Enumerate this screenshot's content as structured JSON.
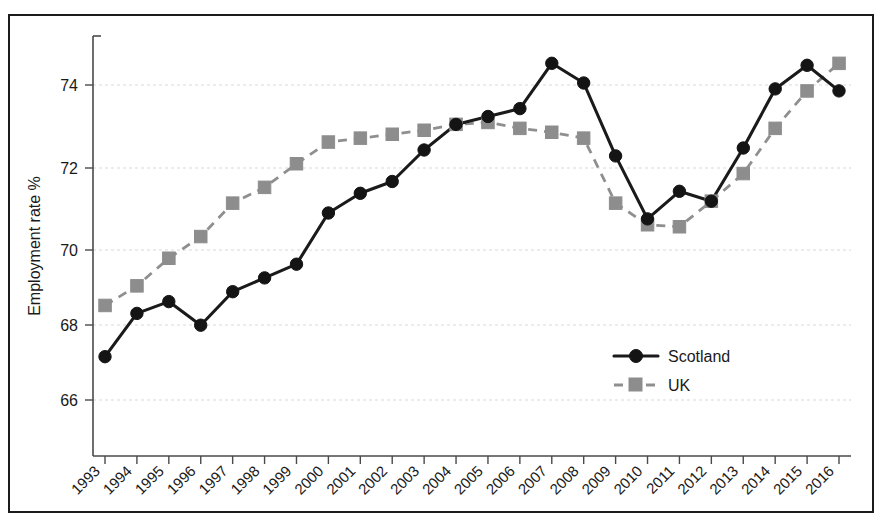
{
  "chart_data": {
    "type": "line",
    "title": "",
    "subtitle": "",
    "xlabel": "",
    "ylabel": "Employment rate %",
    "categories": [
      "1993",
      "1994",
      "1995",
      "1996",
      "1997",
      "1998",
      "1999",
      "2000",
      "2001",
      "2002",
      "2003",
      "2004",
      "2005",
      "2006",
      "2007",
      "2008",
      "2009",
      "2010",
      "2011",
      "2012",
      "2013",
      "2014",
      "2015",
      "2016"
    ],
    "x": [
      1993,
      1994,
      1995,
      1996,
      1997,
      1998,
      1999,
      2000,
      2001,
      2002,
      2003,
      2004,
      2005,
      2006,
      2007,
      2008,
      2009,
      2010,
      2011,
      2012,
      2013,
      2014,
      2015,
      2016
    ],
    "series": [
      {
        "name": "Scotland",
        "color": "#141414",
        "marker": "circle",
        "line_style": "solid",
        "values": [
          67.1,
          68.2,
          68.5,
          67.9,
          68.75,
          69.1,
          69.45,
          70.75,
          71.25,
          71.55,
          72.35,
          73.0,
          73.2,
          73.4,
          74.55,
          74.05,
          72.2,
          70.6,
          71.3,
          71.05,
          72.4,
          73.9,
          74.5,
          73.85
        ]
      },
      {
        "name": "UK",
        "color": "#8d8d8d",
        "marker": "square",
        "line_style": "dashed",
        "values": [
          68.4,
          68.9,
          69.6,
          70.15,
          71.0,
          71.4,
          72.0,
          72.55,
          72.65,
          72.75,
          72.85,
          73.0,
          73.05,
          72.9,
          72.8,
          72.65,
          71.0,
          70.45,
          70.4,
          71.05,
          71.75,
          72.9,
          73.85,
          74.55
        ]
      }
    ],
    "ylim": [
      64.9,
      75.3
    ],
    "yticks": [
      66,
      68,
      70,
      72,
      74
    ],
    "ytick_labels": [
      "66",
      "68",
      "70",
      "72",
      "74"
    ],
    "xlim": [
      1992.5,
      2016.5
    ],
    "grid": true,
    "grid_axis": "y",
    "legend": {
      "position": "inside-bottom-right",
      "entries": [
        "Scotland",
        "UK"
      ]
    }
  },
  "figure": {
    "frame_color": "#1b1b1b",
    "background": "#ffffff",
    "grid_color": "#d9d9d9",
    "axis_color": "#4a4a4a"
  }
}
